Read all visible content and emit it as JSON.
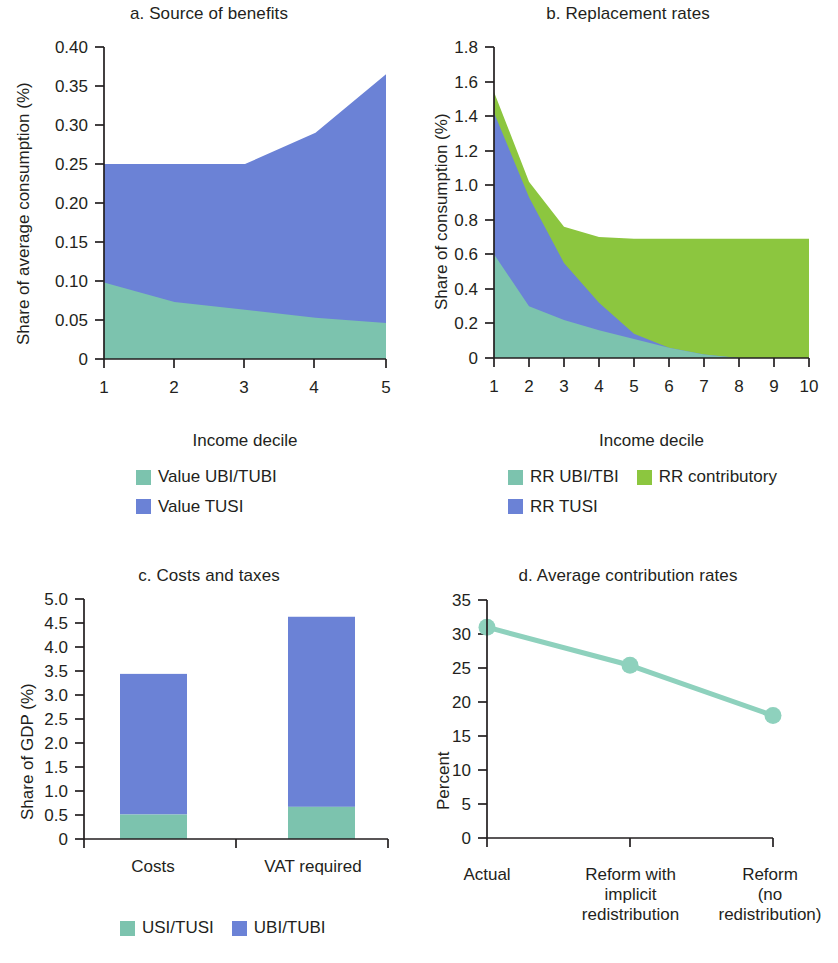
{
  "figure": {
    "background": "#ffffff",
    "text_color": "#231f20"
  },
  "colors": {
    "teal": "#7cc3ae",
    "blue": "#6b82d6",
    "green": "#8cc63f",
    "teal_line": "#8ed1bd",
    "axis": "#231f20"
  },
  "panels": {
    "a": {
      "title": "a. Source of benefits",
      "ylabel": "Share of average consumption (%)",
      "xlabel": "Income decile",
      "yticks": [
        "0.40",
        "0.35",
        "0.30",
        "0.25",
        "0.20",
        "0.15",
        "0.10",
        "0.05",
        "0"
      ],
      "xticks": [
        "1",
        "2",
        "3",
        "4",
        "5"
      ],
      "legend": [
        {
          "label": "Value UBI/TUBI",
          "color": "#7cc3ae"
        },
        {
          "label": "Value TUSI",
          "color": "#6b82d6"
        }
      ]
    },
    "b": {
      "title": "b. Replacement rates",
      "ylabel": "Share of consumption (%)",
      "xlabel": "Income decile",
      "yticks": [
        "1.8",
        "1.6",
        "1.4",
        "1.2",
        "1.0",
        "0.8",
        "0.6",
        "0.4",
        "0.2",
        "0"
      ],
      "xticks": [
        "1",
        "2",
        "3",
        "4",
        "5",
        "6",
        "7",
        "8",
        "9",
        "10"
      ],
      "legend": [
        {
          "label": "RR UBI/TBI",
          "color": "#7cc3ae"
        },
        {
          "label": "RR contributory",
          "color": "#8cc63f"
        },
        {
          "label": "RR TUSI",
          "color": "#6b82d6"
        }
      ]
    },
    "c": {
      "title": "c. Costs and taxes",
      "ylabel": "Share of GDP (%)",
      "xlabel": "",
      "yticks": [
        "5.0",
        "4.5",
        "4.0",
        "3.5",
        "3.0",
        "2.5",
        "2.0",
        "1.5",
        "1.0",
        "0.5",
        "0"
      ],
      "xticks": [
        "Costs",
        "VAT required"
      ],
      "legend": [
        {
          "label": "USI/TUSI",
          "color": "#7cc3ae"
        },
        {
          "label": "UBI/TUBI",
          "color": "#6b82d6"
        }
      ]
    },
    "d": {
      "title": "d. Average contribution rates",
      "ylabel": "Percent",
      "xlabel": "",
      "yticks": [
        "35",
        "30",
        "25",
        "20",
        "15",
        "10",
        "5",
        "0"
      ],
      "xticks": [
        "Actual",
        "Reform with implicit redistribution",
        "Reform (no redistribution)"
      ],
      "xticks_lines": [
        [
          "Actual"
        ],
        [
          "Reform with",
          "implicit",
          "redistribution"
        ],
        [
          "Reform",
          "(no",
          "redistribution)"
        ]
      ]
    }
  },
  "chart_data": [
    {
      "type": "area",
      "panel": "a",
      "title": "a. Source of benefits",
      "xlabel": "Income decile",
      "ylabel": "Share of average consumption (%)",
      "x": [
        1,
        2,
        3,
        4,
        5
      ],
      "xlim": [
        1,
        5
      ],
      "ylim": [
        0,
        0.4
      ],
      "ytick_values": [
        0,
        0.05,
        0.1,
        0.15,
        0.2,
        0.25,
        0.3,
        0.35,
        0.4
      ],
      "stacked": true,
      "grid": false,
      "legend_position": "below",
      "series": [
        {
          "name": "Value UBI/TUBI",
          "color": "#7cc3ae",
          "values": [
            0.098,
            0.073,
            0.063,
            0.053,
            0.046
          ]
        },
        {
          "name": "Value TUSI",
          "color": "#6b82d6",
          "values": [
            0.152,
            0.177,
            0.187,
            0.237,
            0.319
          ]
        }
      ],
      "cumulative_top": [
        0.25,
        0.25,
        0.25,
        0.29,
        0.365
      ]
    },
    {
      "type": "area",
      "panel": "b",
      "title": "b. Replacement rates",
      "xlabel": "Income decile",
      "ylabel": "Share of consumption (%)",
      "x": [
        1,
        2,
        3,
        4,
        5,
        6,
        7,
        8,
        9,
        10
      ],
      "xlim": [
        1,
        10
      ],
      "ylim": [
        0,
        1.8
      ],
      "ytick_values": [
        0,
        0.2,
        0.4,
        0.6,
        0.8,
        1.0,
        1.2,
        1.4,
        1.6,
        1.8
      ],
      "stacked": true,
      "grid": false,
      "legend_position": "below",
      "series": [
        {
          "name": "RR UBI/TBI",
          "color": "#7cc3ae",
          "values": [
            0.6,
            0.3,
            0.22,
            0.16,
            0.11,
            0.06,
            0.02,
            0.0,
            0.0,
            0.0
          ]
        },
        {
          "name": "RR TUSI",
          "color": "#6b82d6",
          "values": [
            0.82,
            0.63,
            0.33,
            0.16,
            0.03,
            0.0,
            0.0,
            0.0,
            0.0,
            0.0
          ]
        },
        {
          "name": "RR contributory",
          "color": "#8cc63f",
          "values": [
            0.12,
            0.09,
            0.21,
            0.38,
            0.55,
            0.63,
            0.67,
            0.69,
            0.69,
            0.69
          ]
        }
      ],
      "cumulative_top": [
        1.54,
        1.02,
        0.76,
        0.7,
        0.69,
        0.69,
        0.69,
        0.69,
        0.69,
        0.69
      ]
    },
    {
      "type": "bar",
      "panel": "c",
      "title": "c. Costs and taxes",
      "xlabel": "",
      "ylabel": "Share of GDP (%)",
      "categories": [
        "Costs",
        "VAT required"
      ],
      "ylim": [
        0,
        5.0
      ],
      "ytick_values": [
        0,
        0.5,
        1.0,
        1.5,
        2.0,
        2.5,
        3.0,
        3.5,
        4.0,
        4.5,
        5.0
      ],
      "stacked": true,
      "grid": false,
      "legend_position": "below",
      "series": [
        {
          "name": "USI/TUSI",
          "color": "#7cc3ae",
          "values": [
            0.51,
            0.67
          ]
        },
        {
          "name": "UBI/TUBI",
          "color": "#6b82d6",
          "values": [
            2.93,
            3.96
          ]
        }
      ],
      "totals": [
        3.44,
        4.63
      ]
    },
    {
      "type": "line",
      "panel": "d",
      "title": "d. Average contribution rates",
      "xlabel": "",
      "ylabel": "Percent",
      "categories": [
        "Actual",
        "Reform with implicit redistribution",
        "Reform (no redistribution)"
      ],
      "values": [
        31.0,
        25.4,
        18.0
      ],
      "ylim": [
        0,
        35
      ],
      "ytick_values": [
        0,
        5,
        10,
        15,
        20,
        25,
        30,
        35
      ],
      "grid": false,
      "markers": true,
      "color": "#8ed1bd"
    }
  ]
}
